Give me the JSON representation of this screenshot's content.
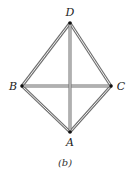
{
  "diagram": {
    "type": "graph",
    "caption": "(b)",
    "nodes": [
      {
        "id": "D",
        "label": "D",
        "x": 70,
        "y": 23,
        "label_x": 70,
        "label_y": 16,
        "anchor": "middle"
      },
      {
        "id": "B",
        "label": "B",
        "x": 22,
        "y": 86,
        "label_x": 13,
        "label_y": 90,
        "anchor": "middle"
      },
      {
        "id": "C",
        "label": "C",
        "x": 111,
        "y": 86,
        "label_x": 121,
        "label_y": 90,
        "anchor": "middle"
      },
      {
        "id": "A",
        "label": "A",
        "x": 70,
        "y": 132,
        "label_x": 70,
        "label_y": 146,
        "anchor": "middle"
      }
    ],
    "edges": [
      [
        "D",
        "B"
      ],
      [
        "D",
        "C"
      ],
      [
        "B",
        "A"
      ],
      [
        "C",
        "A"
      ],
      [
        "B",
        "C"
      ],
      [
        "D",
        "A"
      ]
    ],
    "colors": {
      "edge": "#6f6f6f",
      "edge_core": "#f2f2f2",
      "node": "#111111",
      "text": "#222222"
    }
  }
}
